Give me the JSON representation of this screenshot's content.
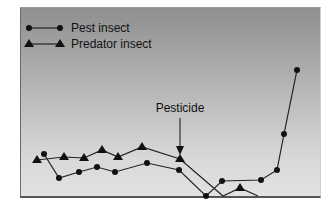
{
  "chart_data": {
    "type": "line",
    "title": "",
    "xlabel": "",
    "ylabel": "",
    "grid": false,
    "legend_position": "top-left",
    "legend": [
      "Pest insect",
      "Predator insect"
    ],
    "annotations": [
      {
        "text": "Pesticide",
        "x_index": 8,
        "arrow": "down"
      }
    ],
    "series": [
      {
        "name": "Pest insect",
        "marker": "circle",
        "points_px": [
          [
            44,
            154
          ],
          [
            59,
            178
          ],
          [
            79,
            172
          ],
          [
            97,
            167
          ],
          [
            115,
            172
          ],
          [
            147,
            163
          ],
          [
            179,
            170
          ],
          [
            206,
            196
          ],
          [
            222,
            181
          ],
          [
            261,
            180
          ],
          [
            277,
            170
          ],
          [
            284,
            134
          ],
          [
            297,
            70
          ]
        ]
      },
      {
        "name": "Predator insect",
        "marker": "triangle",
        "points_px": [
          [
            37,
            160
          ],
          [
            64,
            157
          ],
          [
            84,
            158
          ],
          [
            102,
            150
          ],
          [
            118,
            157
          ],
          [
            142,
            147
          ],
          [
            180,
            159
          ],
          [
            223,
            196
          ],
          [
            240,
            188
          ],
          [
            258,
            196
          ]
        ]
      }
    ]
  },
  "legend": {
    "pest_label": "Pest insect",
    "predator_label": "Predator insect"
  },
  "annotation": {
    "label": "Pesticide"
  }
}
